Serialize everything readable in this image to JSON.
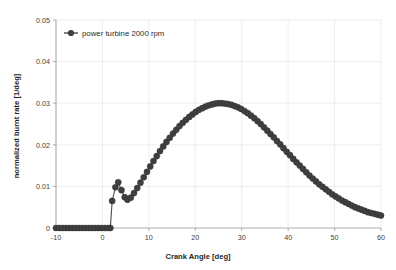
{
  "chart_data": {
    "type": "line",
    "title": "",
    "xlabel": "Crank Angle [deg]",
    "ylabel": "normalized burnt rate [1/deg]",
    "xlim": [
      -10,
      60
    ],
    "ylim": [
      0,
      0.05
    ],
    "xticks": [
      -10,
      0,
      10,
      20,
      30,
      40,
      50,
      60
    ],
    "xticklabels": [
      "-10",
      "0",
      "10",
      "20",
      "30",
      "40",
      "50",
      "60"
    ],
    "yticks": [
      0,
      0.01,
      0.02,
      0.03,
      0.04,
      0.05
    ],
    "yticklabels": [
      "0",
      "0.01",
      "0.02",
      "0.03",
      "0.04",
      "0.05"
    ],
    "grid": true,
    "grid_axes": "both",
    "legend": {
      "position": "upper-left-inside",
      "entries": [
        {
          "label": "power turbine 2000 rpm",
          "color": "#3f3f3f",
          "marker": "circle",
          "linestyle": "solid"
        }
      ]
    },
    "series": [
      {
        "name": "power turbine 2000 rpm",
        "color": "#3f3f3f",
        "marker": "circle",
        "marker_size": 3.1,
        "x": [
          -10,
          -9.3,
          -8.6,
          -7.9,
          -7.2,
          -6.5,
          -5.8,
          -5.1,
          -4.4,
          -3.7,
          -3.0,
          -2.3,
          -1.6,
          -0.9,
          -0.2,
          0.5,
          1.2,
          1.7,
          2.1,
          2.8,
          3.4,
          4.1,
          4.8,
          5.4,
          6.1,
          6.8,
          7.5,
          8.2,
          8.9,
          9.6,
          10.3,
          11.0,
          11.7,
          12.4,
          13.1,
          13.8,
          14.5,
          15.2,
          15.9,
          16.6,
          17.3,
          18.0,
          18.7,
          19.4,
          20.1,
          20.8,
          21.5,
          22.2,
          22.9,
          23.6,
          24.3,
          25.0,
          25.7,
          26.4,
          27.1,
          27.8,
          28.5,
          29.2,
          29.9,
          30.6,
          31.3,
          32.0,
          32.7,
          33.4,
          34.1,
          34.8,
          35.5,
          36.2,
          36.9,
          37.6,
          38.3,
          39.0,
          39.7,
          40.4,
          41.1,
          41.8,
          42.5,
          43.2,
          43.9,
          44.6,
          45.3,
          46.0,
          46.7,
          47.4,
          48.1,
          48.8,
          49.5,
          50.2,
          50.9,
          51.6,
          52.3,
          53.0,
          53.7,
          54.4,
          55.1,
          55.8,
          56.5,
          57.2,
          57.9,
          58.6,
          59.3,
          60.0
        ],
        "y": [
          0,
          0,
          0,
          0,
          0,
          0,
          0,
          0,
          0,
          0,
          0,
          0,
          0,
          0,
          0,
          0,
          0,
          0,
          0.0065,
          0.0098,
          0.011,
          0.0091,
          0.0074,
          0.0068,
          0.0073,
          0.0084,
          0.0096,
          0.0109,
          0.0122,
          0.0135,
          0.0148,
          0.0161,
          0.0173,
          0.0185,
          0.0196,
          0.0207,
          0.0217,
          0.0227,
          0.0236,
          0.0245,
          0.0253,
          0.026,
          0.0267,
          0.0273,
          0.0279,
          0.0284,
          0.0288,
          0.0292,
          0.0295,
          0.0297,
          0.0299,
          0.03,
          0.03,
          0.0299,
          0.0298,
          0.0296,
          0.0293,
          0.029,
          0.0286,
          0.0281,
          0.0276,
          0.027,
          0.0264,
          0.0257,
          0.025,
          0.0242,
          0.0234,
          0.0226,
          0.0218,
          0.0209,
          0.0201,
          0.0192,
          0.0183,
          0.0175,
          0.0166,
          0.0158,
          0.015,
          0.0142,
          0.0134,
          0.0126,
          0.0119,
          0.0112,
          0.0105,
          0.0099,
          0.0093,
          0.0087,
          0.0081,
          0.0076,
          0.0071,
          0.0066,
          0.0062,
          0.0058,
          0.0054,
          0.005,
          0.0047,
          0.0044,
          0.0041,
          0.0038,
          0.0036,
          0.0034,
          0.0032,
          0.003
        ]
      }
    ]
  }
}
